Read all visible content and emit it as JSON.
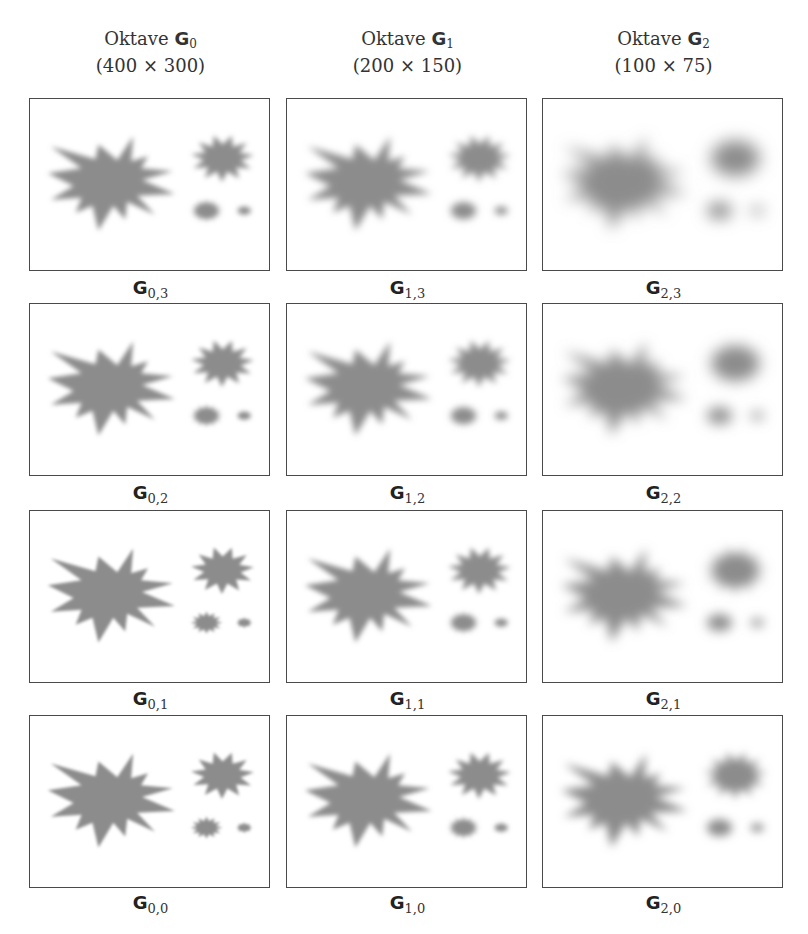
{
  "figure": {
    "fill_color": "#8c8c8c",
    "border_color": "#4a4a4a",
    "columns": [
      {
        "title_prefix": "Oktave ",
        "title_symbol": "G",
        "title_index": "0",
        "size": "(400 × 300)"
      },
      {
        "title_prefix": "Oktave ",
        "title_symbol": "G",
        "title_index": "1",
        "size": "(200 × 150)"
      },
      {
        "title_prefix": "Oktave ",
        "title_symbol": "G",
        "title_index": "2",
        "size": "(100 × 75)"
      }
    ],
    "rows": [
      {
        "level": "3",
        "labels": [
          {
            "symbol": "G",
            "sub": "0,3"
          },
          {
            "symbol": "G",
            "sub": "1,3"
          },
          {
            "symbol": "G",
            "sub": "2,3"
          }
        ]
      },
      {
        "level": "2",
        "labels": [
          {
            "symbol": "G",
            "sub": "0,2"
          },
          {
            "symbol": "G",
            "sub": "1,2"
          },
          {
            "symbol": "G",
            "sub": "2,2"
          }
        ]
      },
      {
        "level": "1",
        "labels": [
          {
            "symbol": "G",
            "sub": "0,1"
          },
          {
            "symbol": "G",
            "sub": "1,1"
          },
          {
            "symbol": "G",
            "sub": "2,1"
          }
        ]
      },
      {
        "level": "0",
        "labels": [
          {
            "symbol": "G",
            "sub": "0,0"
          },
          {
            "symbol": "G",
            "sub": "1,0"
          },
          {
            "symbol": "G",
            "sub": "2,0"
          }
        ]
      }
    ],
    "blur_levels": [
      [
        1.4,
        1.8,
        2.2,
        2.6
      ],
      [
        2.2,
        2.8,
        3.4,
        4.0
      ],
      [
        4.2,
        5.2,
        6.2,
        7.4
      ]
    ]
  }
}
